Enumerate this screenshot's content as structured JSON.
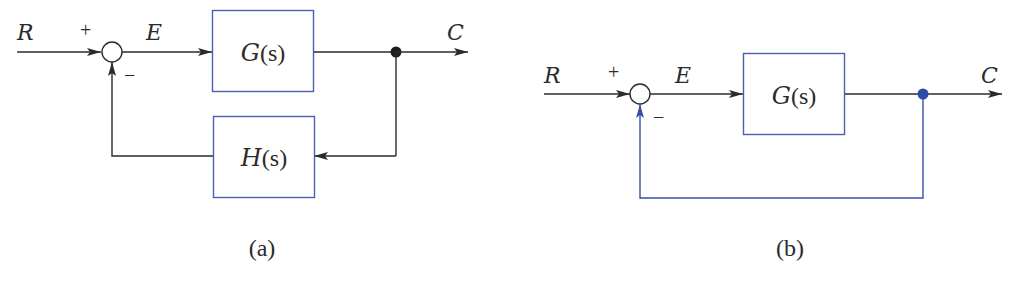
{
  "colors": {
    "line": "#2b2b2b",
    "block_border": "#4a5fae",
    "feedback_blue": "#3a4fa8",
    "dot_blue": "#2f4aa8",
    "dot_black": "#1e1e1e",
    "background": "#ffffff"
  },
  "diagram_a": {
    "caption": "(a)",
    "input_label": "R",
    "error_label": "E",
    "output_label": "C",
    "plus_sign": "+",
    "minus_sign": "−",
    "forward_block": {
      "name": "G",
      "arg": "(s)"
    },
    "feedback_block": {
      "name": "H",
      "arg": "(s)"
    }
  },
  "diagram_b": {
    "caption": "(b)",
    "input_label": "R",
    "error_label": "E",
    "output_label": "C",
    "plus_sign": "+",
    "minus_sign": "−",
    "forward_block": {
      "name": "G",
      "arg": "(s)"
    },
    "feedback": "unity"
  }
}
